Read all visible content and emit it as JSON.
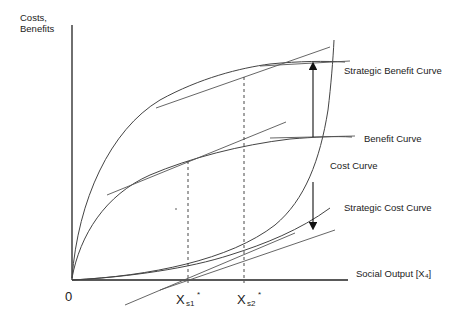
{
  "diagram": {
    "type": "economics-curves",
    "y_axis_label_line1": "Costs,",
    "y_axis_label_line2": "Benefits",
    "x_axis_label": "Social Output [X₄]",
    "origin_label": "0",
    "x_ticks": [
      {
        "main": "X",
        "sub": "s1",
        "sup": "*"
      },
      {
        "main": "X",
        "sub": "s2",
        "sup": "*"
      }
    ],
    "curve_labels": {
      "strategic_benefit": "Strategic Benefit Curve",
      "benefit": "Benefit Curve",
      "cost": "Cost Curve",
      "strategic_cost": "Strategic Cost Curve"
    },
    "colors": {
      "line": "#333333",
      "axis": "#222222",
      "background": "#ffffff"
    }
  }
}
